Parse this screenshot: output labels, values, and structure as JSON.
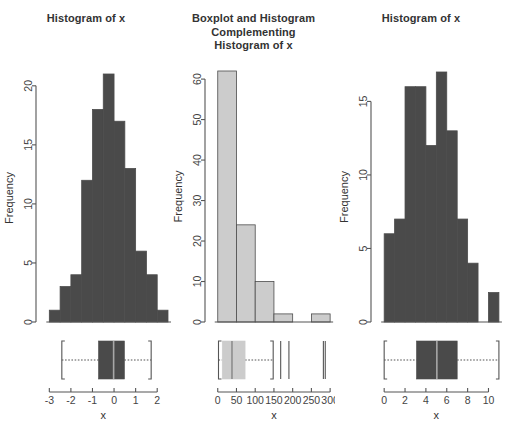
{
  "figure": {
    "background": "#ffffff",
    "ink": "#555555",
    "bar_dark": "#4a4a4a",
    "bar_light": "#cccccc",
    "panel_count": 3
  },
  "panels": [
    {
      "id": "panel-1",
      "title": "Histogram of x",
      "xlabel": "x",
      "ylabel": "Frequency"
    },
    {
      "id": "panel-2",
      "title_lines": [
        "Boxplot and Histogram",
        "Complementing",
        "Histogram of x"
      ],
      "title": "Boxplot and Histogram Complementing Histogram of x",
      "xlabel": "x",
      "ylabel": "Frequency"
    },
    {
      "id": "panel-3",
      "title": "Histogram of x",
      "xlabel": "x",
      "ylabel": "Frequency"
    }
  ],
  "chart_data": [
    {
      "type": "bar",
      "panel": "panel-1",
      "title": "Histogram of x",
      "xlabel": "x",
      "ylabel": "Frequency",
      "subtype": "histogram-with-boxplot",
      "bin_edges": [
        -3.0,
        -2.5,
        -2.0,
        -1.5,
        -1.0,
        -0.5,
        0.0,
        0.5,
        1.0,
        1.5,
        2.0,
        2.5
      ],
      "categories": [
        "-3:-2.5",
        "-2.5:-2",
        "-2:-1.5",
        "-1.5:-1",
        "-1:-0.5",
        "-0.5:0",
        "0:0.5",
        "0.5:1",
        "1:1.5",
        "1.5:2",
        "2:2.5"
      ],
      "values": [
        1,
        3,
        4,
        12,
        18,
        21,
        17,
        13,
        6,
        4,
        1
      ],
      "xlim": [
        -3.2,
        2.5
      ],
      "ylim": [
        0,
        21
      ],
      "xticks": [
        -3,
        -2,
        -1,
        0,
        1,
        2
      ],
      "xticklabels": [
        "-3",
        "-2",
        "-1",
        "0",
        "1",
        "2"
      ],
      "yticks": [
        0,
        5,
        10,
        15,
        20
      ],
      "yticklabels": [
        "0",
        "5",
        "10",
        "15",
        "20"
      ],
      "grid": false,
      "legend": "none",
      "boxplot": {
        "min": -3.15,
        "lower_whisker": -2.42,
        "q1": -0.72,
        "median": -0.02,
        "q3": 0.48,
        "upper_whisker": 1.72,
        "max": 2.3,
        "outliers": []
      }
    },
    {
      "type": "bar",
      "panel": "panel-2",
      "title": "Boxplot and Histogram Complementing Histogram of x",
      "xlabel": "x",
      "ylabel": "Frequency",
      "subtype": "histogram-with-boxplot",
      "bin_edges": [
        0,
        50,
        100,
        150,
        200,
        250,
        300
      ],
      "categories": [
        "0-50",
        "50-100",
        "100-150",
        "150-200",
        "200-250",
        "250-300"
      ],
      "values": [
        62,
        24,
        10,
        2,
        0,
        2
      ],
      "xlim": [
        -10,
        305
      ],
      "ylim": [
        0,
        62
      ],
      "xticks": [
        0,
        50,
        100,
        150,
        200,
        250,
        300
      ],
      "xticklabels": [
        "0",
        "50",
        "100",
        "150",
        "200",
        "250",
        "300"
      ],
      "yticks": [
        0,
        10,
        20,
        30,
        40,
        50,
        60
      ],
      "yticklabels": [
        "0",
        "10",
        "20",
        "30",
        "40",
        "50",
        "60"
      ],
      "grid": false,
      "legend": "none",
      "boxplot": {
        "min": 1,
        "lower_whisker": 2,
        "q1": 12,
        "median": 38,
        "q3": 73,
        "upper_whisker": 148,
        "outliers": [
          168,
          190,
          282,
          287
        ]
      }
    },
    {
      "type": "bar",
      "panel": "panel-3",
      "title": "Histogram of x",
      "xlabel": "x",
      "ylabel": "Frequency",
      "subtype": "histogram-with-boxplot",
      "bin_edges": [
        0,
        1,
        2,
        3,
        4,
        5,
        6,
        7,
        8,
        9,
        10,
        11
      ],
      "categories": [
        "0-1",
        "1-2",
        "2-3",
        "3-4",
        "4-5",
        "5-6",
        "6-7",
        "7-8",
        "8-9",
        "9-10",
        "10-11"
      ],
      "values": [
        6,
        7,
        16,
        16,
        12,
        17,
        13,
        7,
        4,
        0,
        2
      ],
      "xlim": [
        -0.4,
        11.2
      ],
      "ylim": [
        0,
        17
      ],
      "xticks": [
        0,
        2,
        4,
        6,
        8,
        10
      ],
      "xticklabels": [
        "0",
        "2",
        "4",
        "6",
        "8",
        "10"
      ],
      "yticks": [
        0,
        5,
        10,
        15
      ],
      "yticklabels": [
        "0",
        "5",
        "10",
        "15"
      ],
      "grid": false,
      "legend": "none",
      "boxplot": {
        "min": 0,
        "lower_whisker": 0,
        "q1": 3.1,
        "median": 5.05,
        "q3": 7.0,
        "upper_whisker": 11.0,
        "outliers": []
      }
    }
  ]
}
